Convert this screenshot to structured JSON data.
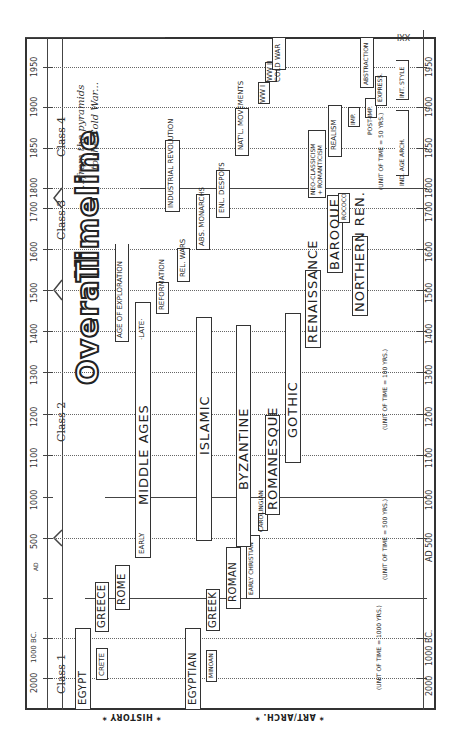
{
  "title": {
    "word1": "Overall",
    "word2": "Timeline",
    "subtitle_line1": "...from the pyramids",
    "subtitle_line2": "to the Cold War..."
  },
  "axis": {
    "end_label": "XXI",
    "ticks": [
      {
        "label": "2000",
        "y": 678
      },
      {
        "label": "1000 BC.",
        "y": 638
      },
      {
        "label": "AD",
        "y": 598
      },
      {
        "label": "500",
        "y": 538
      },
      {
        "label": "1000",
        "y": 497
      },
      {
        "label": "1100",
        "y": 455
      },
      {
        "label": "1200",
        "y": 414
      },
      {
        "label": "1300",
        "y": 372
      },
      {
        "label": "1400",
        "y": 331
      },
      {
        "label": "1500",
        "y": 290
      },
      {
        "label": "1600",
        "y": 249
      },
      {
        "label": "1700",
        "y": 208
      },
      {
        "label": "1800",
        "y": 188
      },
      {
        "label": "1850",
        "y": 148
      },
      {
        "label": "1900",
        "y": 107
      },
      {
        "label": "1950",
        "y": 67
      }
    ],
    "right_ticks": [
      {
        "label": "2000",
        "y": 678
      },
      {
        "label": "1000 BC.",
        "y": 638
      },
      {
        "label": "AD 500",
        "y": 538
      },
      {
        "label": "1000",
        "y": 497
      },
      {
        "label": "1100",
        "y": 455
      },
      {
        "label": "1200",
        "y": 414
      },
      {
        "label": "1300",
        "y": 372
      },
      {
        "label": "1400",
        "y": 331
      },
      {
        "label": "1500",
        "y": 290
      },
      {
        "label": "1600",
        "y": 249
      },
      {
        "label": "1700",
        "y": 208
      },
      {
        "label": "1800",
        "y": 188
      },
      {
        "label": "1850",
        "y": 148
      },
      {
        "label": "1900",
        "y": 107
      },
      {
        "label": "1950",
        "y": 67
      }
    ]
  },
  "classes": [
    {
      "label": "Class 1"
    },
    {
      "label": "Class 2"
    },
    {
      "label": "Class 3"
    },
    {
      "label": "Class 4"
    }
  ],
  "sections": {
    "history": "* HISTORY *",
    "art_arch": "* ART/ARCH. *"
  },
  "history": {
    "egypt": "EGYPT",
    "crete": "CRETE",
    "greece": "GREECE",
    "rome": "ROME",
    "early": "EARLY",
    "middle_ages": "MIDDLE     AGES",
    "late": "·LATE·",
    "age_of_exploration": "AGE OF EXPLORATION",
    "reformation": "REFORMATION",
    "rel_wars": "REL. WARS",
    "industrial_revolution": "INDUSTRIAL  REVOLUTION",
    "abs_monarchs": "ABS. MONARCHS",
    "enl_despots": "ENL. DESPOTS",
    "natl_movements": "NAT'L. MOVEMENTS",
    "wwi": "WW I",
    "wwii": "WW II",
    "cold_war": "COLD WAR"
  },
  "art": {
    "egyptian": "EGYPTIAN",
    "minoan": "MINOAN",
    "greek": "GREEK",
    "roman": "ROMAN",
    "early_christian": "EARLY CHRISTIAN",
    "islamic": "ISLAMIC",
    "byzantine": "BYZANTINE",
    "carolingian": "CAROLINGIAN",
    "romanesque": "ROMANESQUE",
    "gothic": "GOTHIC",
    "renaissance": "RENAISSANCE",
    "baroque": "BAROQUE",
    "rococo": "ROCOCO",
    "northern_ren": "NORTHERN  REN.",
    "neo_classicism": "NEO-CLASSICISM",
    "romanticism": "+ ROMANTICISM",
    "realism": "REALISM",
    "imp": "IMP.",
    "post_imp": "POST-IMP.",
    "express": "EXPRESS.",
    "abstraction": "ABSTRACTION",
    "ind_age_arch": "IND. AGE ARCH.",
    "int_style": "INT. STYLE"
  },
  "units": {
    "u1000": "(UNIT OF TIME = 1000 YRS.)",
    "u500": "(UNIT OF TIME = 500 YRS.)",
    "u100": "(UNIT OF TIME = 100 YRS.)",
    "u50": "(UNIT OF TIME = 50 YRS.)"
  }
}
